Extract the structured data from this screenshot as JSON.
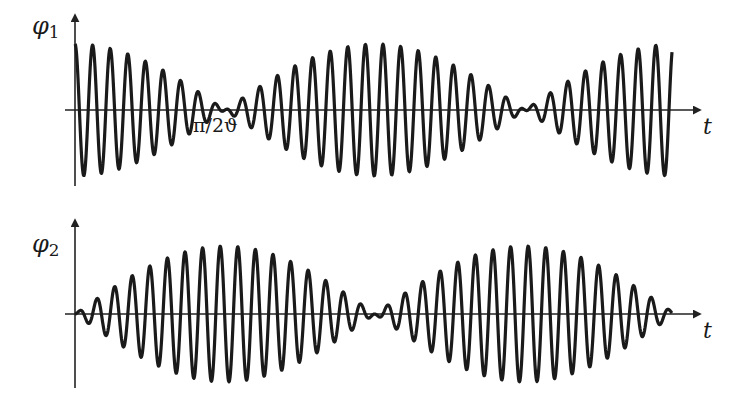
{
  "figure": {
    "stroke_color": "#1a1a1a",
    "axis_color": "#222222",
    "background": "#ffffff"
  },
  "plots": [
    {
      "id": "phi1",
      "y_label_symbol": "φ",
      "y_label_sub": "1",
      "x_label": "t",
      "annotation": "π/2ϑ",
      "origin": {
        "x": 75,
        "y": 110
      },
      "y_axis": {
        "top": 15,
        "bottom": 186
      },
      "x_axis": {
        "left": 65,
        "right": 700
      },
      "signal": {
        "x_start": 75,
        "x_end": 672,
        "amplitude": 66,
        "carrier_period": 17.6,
        "envelope": "cos",
        "envelope_period": 600,
        "carrier": "cos"
      }
    },
    {
      "id": "phi2",
      "y_label_symbol": "φ",
      "y_label_sub": "2",
      "x_label": "t",
      "annotation": "",
      "origin": {
        "x": 75,
        "y": 314
      },
      "y_axis": {
        "top": 220,
        "bottom": 388
      },
      "x_axis": {
        "left": 65,
        "right": 700
      },
      "signal": {
        "x_start": 75,
        "x_end": 672,
        "amplitude": 68,
        "carrier_period": 17.6,
        "envelope": "sin",
        "envelope_period": 600,
        "carrier": "sin"
      }
    }
  ],
  "chart_data": [
    {
      "type": "line",
      "title": "",
      "xlabel": "t",
      "ylabel": "φ1",
      "series": [
        {
          "name": "φ1(t) = cos(ϑt)·cos(ωt)",
          "envelope": "|cos(ϑt)|",
          "first_node": "π/2ϑ"
        }
      ],
      "annotations": [
        "π/2ϑ"
      ],
      "grid": false
    },
    {
      "type": "line",
      "title": "",
      "xlabel": "t",
      "ylabel": "φ2",
      "series": [
        {
          "name": "φ2(t) = sin(ϑt)·sin(ωt)",
          "envelope": "|sin(ϑt)|",
          "first_node": "0"
        }
      ],
      "annotations": [],
      "grid": false
    }
  ]
}
